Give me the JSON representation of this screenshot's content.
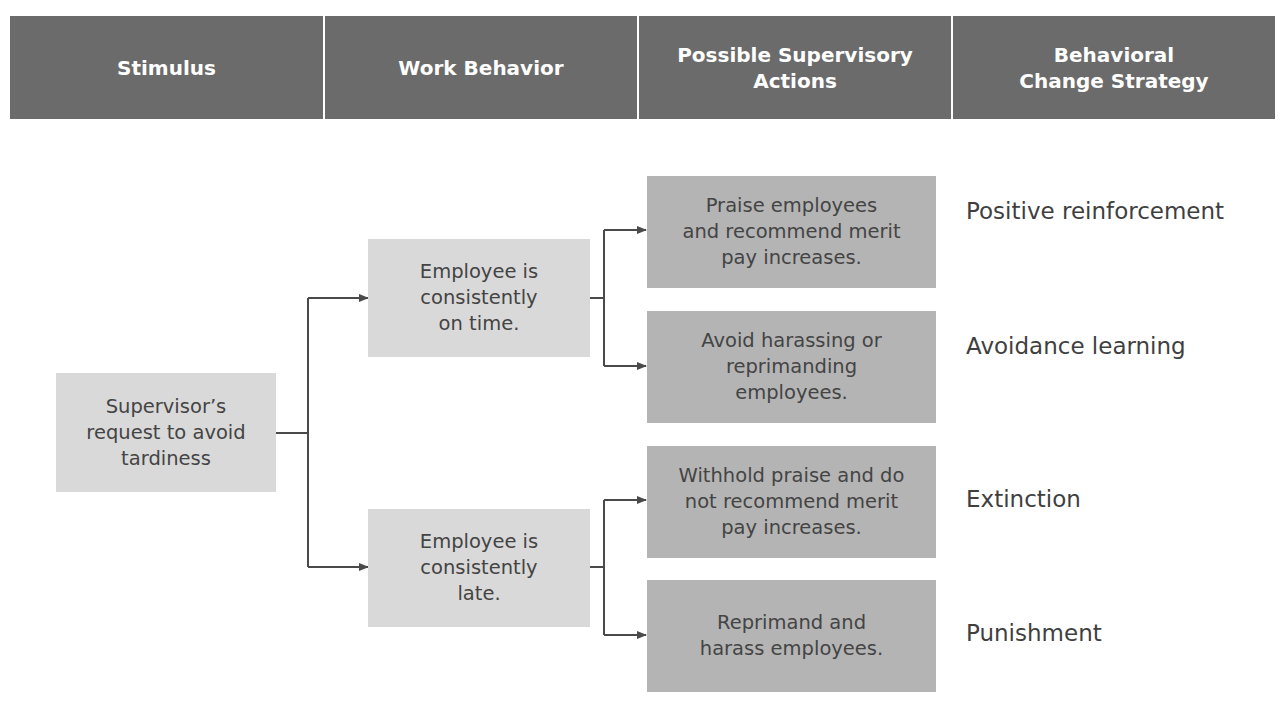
{
  "header": {
    "columns": [
      {
        "label": "Stimulus"
      },
      {
        "label": "Work Behavior"
      },
      {
        "label": "Possible Supervisory\nActions"
      },
      {
        "label": "Behavioral\nChange Strategy"
      }
    ]
  },
  "stimulus": {
    "label": "Supervisor’s\nrequest to avoid\ntardiness"
  },
  "behaviors": [
    {
      "label": "Employee is\nconsistently\non time."
    },
    {
      "label": "Employee is\nconsistently\nlate."
    }
  ],
  "actions": [
    {
      "label": "Praise employees\nand recommend merit\npay increases."
    },
    {
      "label": "Avoid harassing or\nreprimanding\nemployees."
    },
    {
      "label": "Withhold praise and do\nnot recommend merit\npay increases."
    },
    {
      "label": "Reprimand and\nharass employees."
    }
  ],
  "strategies": [
    {
      "label": "Positive reinforcement"
    },
    {
      "label": "Avoidance learning"
    },
    {
      "label": "Extinction"
    },
    {
      "label": "Punishment"
    }
  ],
  "colors": {
    "header_bg": "#6b6b6b",
    "light_box": "#d9d9d9",
    "dark_box": "#b4b4b4",
    "connector": "#4a4a4a"
  }
}
